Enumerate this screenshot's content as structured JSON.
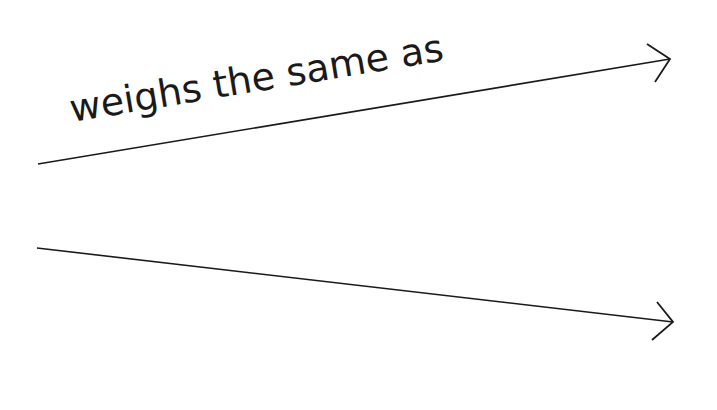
{
  "diagram": {
    "background": "#ffffff",
    "stroke_color": "#1a1a1a",
    "arrows": [
      {
        "id": "upper-arrow",
        "label": "weighs the same as",
        "from": [
          38,
          164
        ],
        "to": [
          670,
          59
        ]
      },
      {
        "id": "lower-arrow",
        "label": "",
        "from": [
          37,
          248
        ],
        "to": [
          673,
          322
        ]
      }
    ]
  }
}
